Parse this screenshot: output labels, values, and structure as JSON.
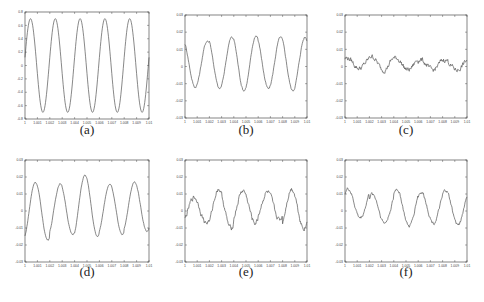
{
  "figure": {
    "background": "#ffffff",
    "line_color": "#555555",
    "axis_color": "#333333"
  },
  "chart_data": [
    {
      "id": "a",
      "type": "line",
      "caption": "(a)",
      "title": "",
      "xlabel": "",
      "ylabel": "",
      "xlim": [
        1.0,
        1.01
      ],
      "ylim": [
        -0.8,
        0.8
      ],
      "x_ticks": [
        "1",
        "1.001",
        "1.002",
        "1.003",
        "1.004",
        "1.005",
        "1.006",
        "1.007",
        "1.008",
        "1.009",
        "1.01"
      ],
      "y_ticks": [
        "0.8",
        "0.6",
        "0.4",
        "0.2",
        "0",
        "-0.2",
        "-0.4",
        "-0.6",
        "-0.8"
      ],
      "grid": false,
      "series": [
        {
          "name": "signal",
          "shape": "sinusoid",
          "amplitude": 0.7,
          "offset": 0.0,
          "cycles": 5,
          "phase_deg": 10,
          "noise": 0.0
        }
      ],
      "peaks": [
        0.7,
        0.7,
        0.7,
        0.7,
        0.7
      ],
      "troughs": [
        -0.7,
        -0.7,
        -0.7,
        -0.7,
        -0.7
      ]
    },
    {
      "id": "b",
      "type": "line",
      "caption": "(b)",
      "title": "",
      "xlabel": "",
      "ylabel": "",
      "xlim": [
        1.0,
        1.01
      ],
      "ylim": [
        -0.03,
        0.03
      ],
      "x_ticks": [
        "1",
        "1.001",
        "1.002",
        "1.003",
        "1.004",
        "1.005",
        "1.006",
        "1.007",
        "1.008",
        "1.009",
        "1.01"
      ],
      "y_ticks": [
        "0.03",
        "0.02",
        "0.01",
        "0",
        "-0.01",
        "-0.02",
        "-0.03"
      ],
      "grid": false,
      "series": [
        {
          "name": "signal",
          "shape": "sinusoid",
          "amplitude": 0.0145,
          "offset": 0.0015,
          "cycles": 5,
          "phase_deg": 120,
          "noise": 0.0005
        }
      ],
      "peaks": [
        0.015,
        0.017,
        0.018,
        0.017,
        0.017
      ],
      "troughs": [
        -0.012,
        -0.013,
        -0.014,
        -0.013,
        -0.014
      ]
    },
    {
      "id": "c",
      "type": "line",
      "caption": "(c)",
      "title": "",
      "xlabel": "",
      "ylabel": "",
      "xlim": [
        1.0,
        1.01
      ],
      "ylim": [
        -0.03,
        0.03
      ],
      "x_ticks": [
        "1",
        "1.001",
        "1.002",
        "1.003",
        "1.004",
        "1.005",
        "1.006",
        "1.007",
        "1.008",
        "1.009",
        "1.01"
      ],
      "y_ticks": [
        "0.03",
        "0.02",
        "0.01",
        "0",
        "-0.01",
        "-0.02",
        "-0.03"
      ],
      "grid": false,
      "series": [
        {
          "name": "signal",
          "shape": "sinusoid",
          "amplitude": 0.004,
          "offset": 0.0015,
          "cycles": 5,
          "phase_deg": 60,
          "noise": 0.0012
        }
      ],
      "peaks": [
        0.005,
        0.006,
        0.005,
        0.004,
        0.004
      ],
      "troughs": [
        -0.001,
        -0.002,
        -0.002,
        -0.002,
        -0.002
      ]
    },
    {
      "id": "d",
      "type": "line",
      "caption": "(d)",
      "title": "",
      "xlabel": "",
      "ylabel": "",
      "xlim": [
        1.0,
        1.01
      ],
      "ylim": [
        -0.03,
        0.03
      ],
      "x_ticks": [
        "1",
        "1.001",
        "1.002",
        "1.003",
        "1.004",
        "1.005",
        "1.006",
        "1.007",
        "1.008",
        "1.009",
        "1.01"
      ],
      "y_ticks": [
        "0.03",
        "0.02",
        "0.01",
        "0",
        "-0.01",
        "-0.02",
        "-0.03"
      ],
      "grid": false,
      "series": [
        {
          "name": "signal",
          "shape": "sinusoid",
          "amplitude": 0.0175,
          "offset": 0.0005,
          "cycles": 5,
          "phase_deg": -60,
          "noise": 0.0003
        }
      ],
      "peaks": [
        0.017,
        0.016,
        0.021,
        0.016,
        0.017
      ],
      "troughs": [
        -0.017,
        -0.014,
        -0.015,
        -0.014,
        -0.012
      ]
    },
    {
      "id": "e",
      "type": "line",
      "caption": "(e)",
      "title": "",
      "xlabel": "",
      "ylabel": "",
      "xlim": [
        1.0,
        1.01
      ],
      "ylim": [
        -0.03,
        0.03
      ],
      "x_ticks": [
        "1",
        "1.001",
        "1.002",
        "1.003",
        "1.004",
        "1.005",
        "1.006",
        "1.007",
        "1.008",
        "1.009",
        "1.01"
      ],
      "y_ticks": [
        "0.03",
        "0.02",
        "0.01",
        "0",
        "-0.01",
        "-0.02",
        "-0.03"
      ],
      "grid": false,
      "series": [
        {
          "name": "signal",
          "shape": "sinusoid",
          "amplitude": 0.011,
          "offset": 0.002,
          "cycles": 5,
          "phase_deg": -45,
          "noise": 0.0012
        }
      ],
      "peaks": [
        0.008,
        0.013,
        0.012,
        0.011,
        0.013
      ],
      "troughs": [
        -0.007,
        -0.01,
        -0.007,
        -0.005,
        -0.01
      ]
    },
    {
      "id": "f",
      "type": "line",
      "caption": "(f)",
      "title": "",
      "xlabel": "",
      "ylabel": "",
      "xlim": [
        1.0,
        1.01
      ],
      "ylim": [
        -0.03,
        0.03
      ],
      "x_ticks": [
        "1",
        "1.001",
        "1.002",
        "1.003",
        "1.004",
        "1.005",
        "1.006",
        "1.007",
        "1.008",
        "1.009",
        "1.01"
      ],
      "y_ticks": [
        "0.03",
        "0.02",
        "0.01",
        "0",
        "-0.01",
        "-0.02",
        "-0.03"
      ],
      "grid": false,
      "series": [
        {
          "name": "signal",
          "shape": "sinusoid",
          "amplitude": 0.0105,
          "offset": 0.001,
          "cycles": 5,
          "phase_deg": 45,
          "noise": 0.0008
        }
      ],
      "peaks": [
        0.013,
        0.01,
        0.013,
        0.011,
        0.012
      ],
      "troughs": [
        -0.004,
        -0.007,
        -0.009,
        -0.007,
        -0.008
      ]
    }
  ],
  "layout": {
    "panels": [
      {
        "id": "a",
        "box": [
          25,
          12,
          124,
          107
        ],
        "caption_pos": [
          67,
          122
        ]
      },
      {
        "id": "b",
        "box": [
          185,
          15,
          122,
          103
        ],
        "caption_pos": [
          226,
          122
        ]
      },
      {
        "id": "c",
        "box": [
          345,
          15,
          122,
          103
        ],
        "caption_pos": [
          386,
          122
        ]
      },
      {
        "id": "d",
        "box": [
          25,
          160,
          124,
          102
        ],
        "caption_pos": [
          67,
          264
        ]
      },
      {
        "id": "e",
        "box": [
          185,
          160,
          122,
          102
        ],
        "caption_pos": [
          226,
          264
        ]
      },
      {
        "id": "f",
        "box": [
          345,
          160,
          122,
          102
        ],
        "caption_pos": [
          386,
          264
        ]
      }
    ]
  }
}
